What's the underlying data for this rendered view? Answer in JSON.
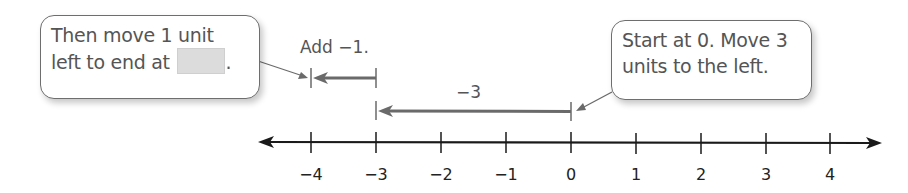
{
  "callouts": {
    "left": {
      "line1": "Then move 1 unit",
      "line2": "left to end at",
      "blank": "",
      "end": "."
    },
    "right": {
      "line1": "Start at 0. Move 3",
      "line2": "units to the left."
    }
  },
  "annotations": {
    "add_label": "Add −1.",
    "move_label": "−3"
  },
  "number_line": {
    "min": -4,
    "max": 4,
    "ticks": [
      "−4",
      "−3",
      "−2",
      "−1",
      "0",
      "1",
      "2",
      "3",
      "4"
    ]
  },
  "arrows": {
    "first_move": {
      "from": 0,
      "to": -3,
      "value": -3
    },
    "second_move": {
      "from": -3,
      "to": -4,
      "value": -1
    }
  },
  "colors": {
    "line": "#1a1a1a",
    "arrow": "#6a6a6a",
    "callout_border": "#6e6e6e",
    "blank_fill": "#dcdcdc"
  }
}
